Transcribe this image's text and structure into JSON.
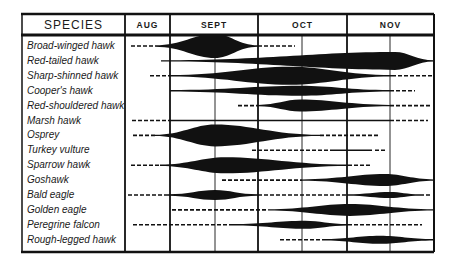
{
  "chart_data": {
    "type": "timeline",
    "title": "",
    "header": {
      "species_label": "SPECIES",
      "months": [
        "AUG",
        "SEPT",
        "OCT",
        "NOV"
      ]
    },
    "legend": {
      "solid": "main migration (thickness = relative abundance)",
      "dashed": "occasional / stragglers"
    },
    "month_columns_px": {
      "AUG": [
        125,
        170
      ],
      "SEPT": [
        170,
        258
      ],
      "OCT": [
        258,
        347
      ],
      "NOV": [
        347,
        434
      ]
    },
    "mid_month_lines_px": [
      215,
      302,
      390
    ],
    "species": [
      {
        "name": "Broad-winged hawk",
        "segments": [
          {
            "style": "dash",
            "x0": 131,
            "x1": 155
          },
          {
            "style": "solid",
            "x0": 155,
            "x1": 258,
            "peak": 215,
            "h": 12
          },
          {
            "style": "dash",
            "x0": 258,
            "x1": 295
          }
        ]
      },
      {
        "name": "Red-tailed hawk",
        "segments": [
          {
            "style": "solid",
            "x0": 161,
            "x1": 434,
            "peak": 395,
            "h": 9
          }
        ]
      },
      {
        "name": "Sharp-shinned hawk",
        "segments": [
          {
            "style": "dash",
            "x0": 150,
            "x1": 170
          },
          {
            "style": "solid",
            "x0": 170,
            "x1": 392,
            "peak": 290,
            "h": 9
          },
          {
            "style": "dash",
            "x0": 392,
            "x1": 432
          }
        ]
      },
      {
        "name": "Cooper's hawk",
        "segments": [
          {
            "style": "solid",
            "x0": 170,
            "x1": 390,
            "peak": 300,
            "h": 5
          },
          {
            "style": "dash",
            "x0": 390,
            "x1": 415
          }
        ]
      },
      {
        "name": "Red-shouldered hawk",
        "segments": [
          {
            "style": "dash",
            "x0": 238,
            "x1": 258
          },
          {
            "style": "solid",
            "x0": 258,
            "x1": 390,
            "peak": 300,
            "h": 6
          },
          {
            "style": "dash",
            "x0": 390,
            "x1": 432
          }
        ]
      },
      {
        "name": "Marsh hawk",
        "segments": [
          {
            "style": "dash",
            "x0": 132,
            "x1": 170
          },
          {
            "style": "solid",
            "x0": 170,
            "x1": 390,
            "peak": 280,
            "h": 0.8
          },
          {
            "style": "dash",
            "x0": 390,
            "x1": 428
          }
        ]
      },
      {
        "name": "Osprey",
        "segments": [
          {
            "style": "dash",
            "x0": 133,
            "x1": 155
          },
          {
            "style": "solid",
            "x0": 155,
            "x1": 320,
            "peak": 215,
            "h": 11
          },
          {
            "style": "dash",
            "x0": 320,
            "x1": 378
          }
        ]
      },
      {
        "name": "Turkey vulture",
        "segments": [
          {
            "style": "dash",
            "x0": 252,
            "x1": 330
          },
          {
            "style": "solid",
            "x0": 330,
            "x1": 372,
            "peak": 350,
            "h": 0.8
          },
          {
            "style": "dash",
            "x0": 375,
            "x1": 387
          }
        ]
      },
      {
        "name": "Sparrow hawk",
        "segments": [
          {
            "style": "dash",
            "x0": 131,
            "x1": 160
          },
          {
            "style": "solid",
            "x0": 160,
            "x1": 348,
            "peak": 225,
            "h": 8
          },
          {
            "style": "dash",
            "x0": 348,
            "x1": 372
          }
        ]
      },
      {
        "name": "Goshawk",
        "segments": [
          {
            "style": "dash",
            "x0": 222,
            "x1": 302
          },
          {
            "style": "solid",
            "x0": 302,
            "x1": 434,
            "peak": 385,
            "h": 6
          }
        ]
      },
      {
        "name": "Bald eagle",
        "segments": [
          {
            "style": "dash",
            "x0": 128,
            "x1": 168
          },
          {
            "style": "solid",
            "x0": 168,
            "x1": 258,
            "peak": 215,
            "h": 5
          },
          {
            "style": "dash",
            "x0": 258,
            "x1": 347
          },
          {
            "style": "solid",
            "x0": 347,
            "x1": 420,
            "peak": 390,
            "h": 3
          },
          {
            "style": "dash",
            "x0": 420,
            "x1": 432
          }
        ]
      },
      {
        "name": "Golden eagle",
        "segments": [
          {
            "style": "dash",
            "x0": 172,
            "x1": 268
          },
          {
            "style": "solid",
            "x0": 268,
            "x1": 434,
            "peak": 350,
            "h": 6
          }
        ]
      },
      {
        "name": "Peregrine falcon",
        "segments": [
          {
            "style": "dash",
            "x0": 133,
            "x1": 232
          },
          {
            "style": "solid",
            "x0": 232,
            "x1": 348,
            "peak": 305,
            "h": 4
          },
          {
            "style": "dash",
            "x0": 348,
            "x1": 422
          }
        ]
      },
      {
        "name": "Rough-legged hawk",
        "segments": [
          {
            "style": "dash",
            "x0": 280,
            "x1": 322
          },
          {
            "style": "solid",
            "x0": 322,
            "x1": 434,
            "peak": 380,
            "h": 4
          }
        ]
      }
    ]
  },
  "colors": {
    "ink": "#111111",
    "background": "#ffffff",
    "grid": "#222222"
  }
}
